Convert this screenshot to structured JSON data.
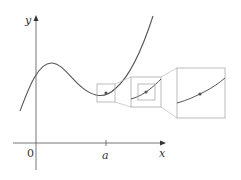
{
  "diagram": {
    "axes": {
      "x_label": "x",
      "y_label": "y",
      "origin_label": "0",
      "tick_label": "a"
    },
    "colors": {
      "curve": "#555555",
      "axes": "#666666",
      "boxes": "#aaaaaa",
      "point": "#555555"
    },
    "zoom_levels": 3
  }
}
